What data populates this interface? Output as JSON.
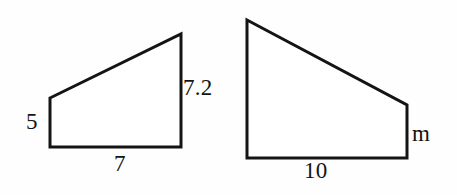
{
  "figure": {
    "kind": "geometry-diagram",
    "stroke_color": "#141414",
    "background_color": "#fefefe",
    "text_color": "#141414",
    "stroke_width": 3
  },
  "shapes": [
    {
      "id": "left-trapezoid",
      "name": "small-trapezoid",
      "vertices": [
        [
          50,
          98
        ],
        [
          181,
          34
        ],
        [
          181,
          147
        ],
        [
          50,
          147
        ]
      ],
      "labels": {
        "left_side": "5",
        "right_side": "7.2",
        "bottom_side": "7"
      }
    },
    {
      "id": "right-trapezoid",
      "name": "large-trapezoid",
      "vertices": [
        [
          247,
          20
        ],
        [
          407,
          105
        ],
        [
          407,
          158
        ],
        [
          247,
          158
        ]
      ],
      "labels": {
        "bottom_side": "10",
        "right_side": "m"
      }
    }
  ]
}
